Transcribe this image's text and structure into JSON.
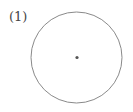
{
  "figure": {
    "label": "(1)",
    "circle": {
      "cx": 76.5,
      "cy": 57.5,
      "r": 45.5,
      "stroke": "#8a8a8a"
    },
    "center_point": {
      "cx": 77,
      "cy": 57.5,
      "r": 1.6,
      "fill": "#555555"
    }
  }
}
